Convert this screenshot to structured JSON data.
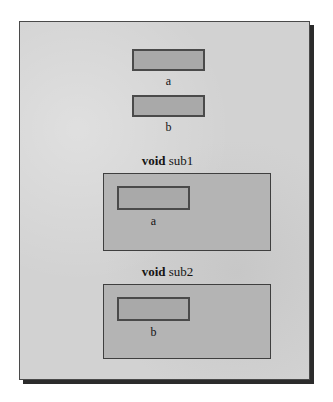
{
  "figure": {
    "kind": "scope-diagram",
    "background_color": "#ffffff",
    "page_color": "#d2d2d2",
    "page_border_color": "#4a4a4a",
    "shadow_color": "#2b2b2b",
    "variable_box_color": "#a9a9a9",
    "frame_box_color": "#b4b4b4",
    "text_color": "#151515"
  },
  "globals": [
    {
      "box_name": "variable-box-a",
      "label": "a"
    },
    {
      "box_name": "variable-box-b",
      "label": "b"
    }
  ],
  "subroutines": [
    {
      "keyword": "void",
      "name": "sub1",
      "variable": {
        "box_name": "variable-box-a",
        "label": "a"
      }
    },
    {
      "keyword": "void",
      "name": "sub2",
      "variable": {
        "box_name": "variable-box-b",
        "label": "b"
      }
    }
  ]
}
